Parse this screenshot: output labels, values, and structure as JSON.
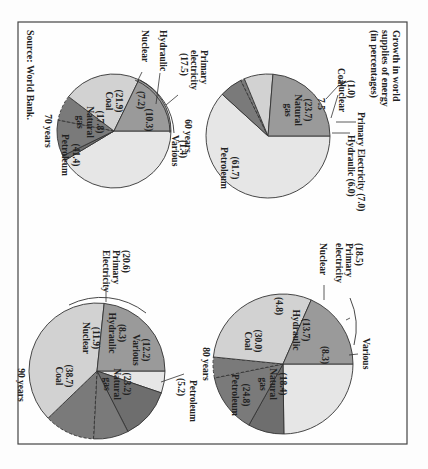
{
  "figure": {
    "title_lines": [
      "Growth in world",
      "supplies of energy",
      "(in percentages)"
    ],
    "source": "Source: World Bank.",
    "rotation": "90deg clockwise"
  },
  "colors": {
    "petroleum": "#e6e6e6",
    "natural_gas": "#9a9a9a",
    "coal": "#d2d2d2",
    "primary": "#7a7a7a",
    "various": "#6e6e6e",
    "outline": "#333333"
  },
  "chart_data": [
    {
      "type": "pie",
      "title": "60 years",
      "slices": [
        {
          "label": "Petroleum",
          "value": 61.7
        },
        {
          "label": "Natural gas",
          "value": 23.7
        },
        {
          "label": "Coal",
          "value": 7.5
        },
        {
          "label": "Nuclear",
          "value": 1.0
        },
        {
          "label": "Hydraulic",
          "value": 6.0
        }
      ],
      "group": {
        "label": "Primary Electricity",
        "value": 7.0,
        "members": [
          "Nuclear",
          "Hydraulic"
        ]
      },
      "annotations": [
        "Primary Electricity (7.0)",
        "Hydraulic (6.0)",
        "(1.0) Nuclear",
        "Coal",
        "7.5",
        "(23.7) Natural gas",
        "(61.7) Petroleum"
      ]
    },
    {
      "type": "pie",
      "title": "70 years",
      "slices": [
        {
          "label": "Petroleum",
          "value": 41.4
        },
        {
          "label": "Natural gas",
          "value": 17.8
        },
        {
          "label": "Coal",
          "value": 21.9
        },
        {
          "label": "Nuclear",
          "value": 7.2
        },
        {
          "label": "Hydraulic",
          "value": 10.3
        },
        {
          "label": "Various",
          "value": 1.4
        }
      ],
      "group": {
        "label": "Primary electricity",
        "value": 17.5,
        "members": [
          "Nuclear",
          "Hydraulic"
        ]
      }
    },
    {
      "type": "pie",
      "title": "80 years",
      "slices": [
        {
          "label": "Petroleum",
          "value": 24.8
        },
        {
          "label": "Natural gas",
          "value": 18.4
        },
        {
          "label": "Coal",
          "value": 30.0
        },
        {
          "label": "Nuclear",
          "value": 4.8
        },
        {
          "label": "Hydraulic",
          "value": 13.7
        },
        {
          "label": "Various",
          "value": 8.3
        }
      ],
      "group": {
        "label": "Primary electricity",
        "value": 18.5,
        "members": [
          "Nuclear",
          "Hydraulic"
        ]
      }
    },
    {
      "type": "pie",
      "title": "90 years",
      "slices": [
        {
          "label": "Petroleum",
          "value": 5.2
        },
        {
          "label": "Natural gas",
          "value": 23.2
        },
        {
          "label": "Coal",
          "value": 38.7
        },
        {
          "label": "Nuclear",
          "value": 11.9
        },
        {
          "label": "Hydraulic",
          "value": 8.3
        },
        {
          "label": "Various",
          "value": 12.2
        }
      ],
      "group": {
        "label": "Primary Electricity",
        "value": 20.6,
        "members": [
          "Nuclear",
          "Hydraulic"
        ]
      }
    }
  ],
  "labels": {
    "p60": {
      "year": "60 years",
      "petroleum_val": "(61.7)",
      "petroleum": "Petroleum",
      "gas_val": "(23.7)",
      "gas1": "Natural",
      "gas2": "gas",
      "coal_val": "7.5",
      "coal": "Coal",
      "nuclear_val": "(1.0)",
      "nuclear": "Nuclear",
      "primary": "Primary Electricity (7.0)",
      "hydraulic": "Hydraulic (6.0)"
    },
    "p70": {
      "year": "70 years",
      "petroleum_val": "(41.4)",
      "petroleum": "Petroleum",
      "gas_val": "(17.8)",
      "gas1": "Natural",
      "gas2": "gas",
      "coal_val": "(21.9)",
      "coal": "Coal",
      "nuclear_val": "(7.2)",
      "nuclear": "Nuclear",
      "hydraulic_val": "(10.3)",
      "hydraulic": "Hydraulic",
      "various_val": "(1.4)",
      "various": "Various",
      "primary1": "Primary",
      "primary2": "electricity",
      "primary_val": "(17.5)"
    },
    "p80": {
      "year": "80 years",
      "petroleum_val": "(24.8)",
      "petroleum": "Petroleum",
      "gas_val": "(18.4)",
      "gas1": "Natural",
      "gas2": "gas",
      "coal_val": "(30.0)",
      "coal": "Coal",
      "nuclear_val": "(4.8)",
      "nuclear": "Nuclear",
      "hydraulic_val": "(13.7)",
      "hydraulic": "Hydraulic",
      "various_val": "(8.3)",
      "various": "Various",
      "primary_val": "(18.5)",
      "primary1": "Primary",
      "primary2": "electricity"
    },
    "p90": {
      "year": "90 years",
      "petroleum_val": "(5.2)",
      "petroleum": "Petroleum",
      "gas_val": "(23.2)",
      "gas1": "Natural",
      "gas2": "gas",
      "coal_val": "(38.7)",
      "coal": "Coal",
      "nuclear_val": "(11.9)",
      "nuclear": "Nuclear",
      "hydraulic_val": "(8.3)",
      "hydraulic": "Hydraulic",
      "various_val": "(12.2)",
      "various": "Various",
      "primary_val": "(20.6)",
      "primary1": "Primary",
      "primary2": "Electricity"
    }
  }
}
